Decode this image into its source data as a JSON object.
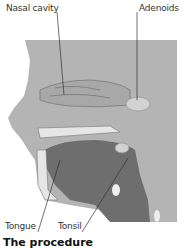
{
  "diagram": {
    "labels": {
      "nasal_cavity": "Nasal cavity",
      "adenoids": "Adenoids",
      "tongue": "Tongue",
      "tonsil": "Tonsil"
    },
    "section_title": "The procedure",
    "colors": {
      "background": "#ffffff",
      "tissue": "#b4b4b4",
      "tissue_dark": "#8a8a8a",
      "mouth_dark": "#6e6e6e",
      "bone": "#e6e6e6",
      "adenoid": "#d2d2d2",
      "leader_line": "#333333"
    }
  }
}
